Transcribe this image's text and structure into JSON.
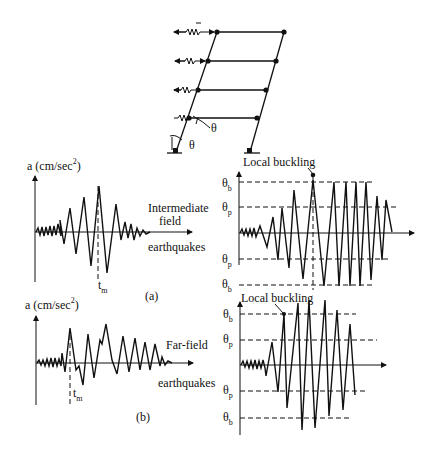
{
  "figure": {
    "frame_diagram": {
      "storeys": 4,
      "rotation_labels": [
        "θ",
        "θ"
      ]
    },
    "panel_a": {
      "ylabel": "a (cm/sec",
      "ylabel_sup": "2",
      "ylabel_close": ")",
      "label_line1": "Intermediate",
      "label_line2": "field",
      "label_line3": "earthquakes",
      "tm": "t",
      "tm_sub": "m",
      "caption": "(a)"
    },
    "panel_b": {
      "ylabel": "a (cm/sec",
      "ylabel_sup": "2",
      "ylabel_close": ")",
      "label_line1": "Far-field",
      "label_line2": "earthquakes",
      "tm": "t",
      "tm_sub": "m",
      "caption": "(b)"
    },
    "response_a": {
      "annotation": "Local buckling",
      "theta": "θ",
      "levels": [
        {
          "main": "θ",
          "sub": "b"
        },
        {
          "main": "θ",
          "sub": "p"
        },
        {
          "main": "θ",
          "sub": "p"
        },
        {
          "main": "θ",
          "sub": "b"
        }
      ]
    },
    "response_b": {
      "annotation": "Local buckling",
      "levels": [
        {
          "main": "θ",
          "sub": "b"
        },
        {
          "main": "θ",
          "sub": "p"
        },
        {
          "main": "θ",
          "sub": "p"
        },
        {
          "main": "θ",
          "sub": "b"
        }
      ]
    }
  }
}
